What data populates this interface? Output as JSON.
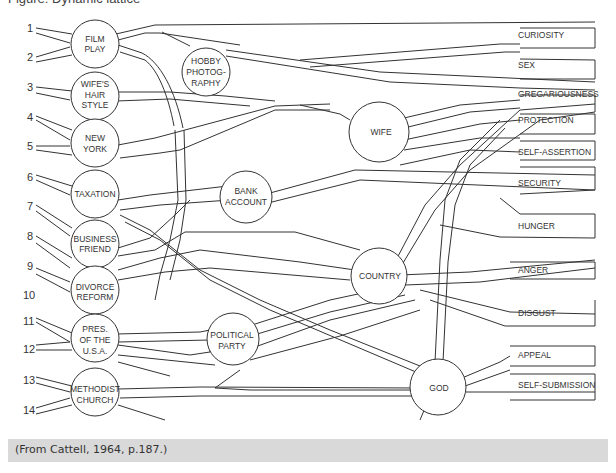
{
  "figure": {
    "title_partial": "Figure: Dynamic lattice",
    "caption": "(From Cattell, 1964, p.187.)",
    "caption_bg": "#d9d9d9",
    "line_color": "#333333"
  },
  "attitudes": [
    {
      "num": "1"
    },
    {
      "num": "2"
    },
    {
      "num": "3"
    },
    {
      "num": "4"
    },
    {
      "num": "5"
    },
    {
      "num": "6"
    },
    {
      "num": "7"
    },
    {
      "num": "8"
    },
    {
      "num": "9"
    },
    {
      "num": "10"
    },
    {
      "num": "11"
    },
    {
      "num": "12"
    },
    {
      "num": "13"
    },
    {
      "num": "14"
    }
  ],
  "attitude_nodes": [
    {
      "lines": [
        "FILM",
        "PLAY"
      ]
    },
    {
      "lines": [
        "WIFE'S",
        "HAIR",
        "STYLE"
      ]
    },
    {
      "lines": [
        "NEW",
        "YORK"
      ]
    },
    {
      "lines": [
        "TAXATION"
      ]
    },
    {
      "lines": [
        "BUSINESS",
        "FRIEND"
      ]
    },
    {
      "lines": [
        "DIVORCE",
        "REFORM"
      ]
    },
    {
      "lines": [
        "PRES.",
        "OF THE",
        "U.S.A."
      ]
    },
    {
      "lines": [
        "METHODIST",
        "CHURCH"
      ]
    }
  ],
  "sentiment_nodes": [
    {
      "lines": [
        "HOBBY",
        "PHOTOG-",
        "RAPHY"
      ]
    },
    {
      "lines": [
        "WIFE"
      ]
    },
    {
      "lines": [
        "BANK",
        "ACCOUNT"
      ]
    },
    {
      "lines": [
        "COUNTRY"
      ]
    },
    {
      "lines": [
        "POLITICAL",
        "PARTY"
      ]
    },
    {
      "lines": [
        "GOD"
      ]
    }
  ],
  "ergs": [
    {
      "label": "CURIOSITY"
    },
    {
      "label": "SEX"
    },
    {
      "label": "GREGARIOUSNESS"
    },
    {
      "label": "PROTECTION"
    },
    {
      "label": "SELF-ASSERTION"
    },
    {
      "label": "SECURITY"
    },
    {
      "label": "HUNGER"
    },
    {
      "label": "ANGER"
    },
    {
      "label": "DISGUST"
    },
    {
      "label": "APPEAL"
    },
    {
      "label": "SELF-SUBMISSION"
    }
  ]
}
